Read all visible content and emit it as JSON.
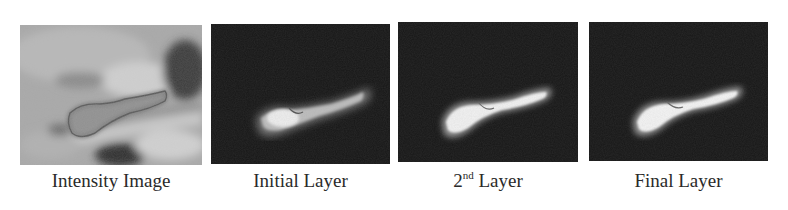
{
  "figure": {
    "panels": [
      {
        "id": "intensity",
        "caption": "Intensity Image",
        "type": "grayscale-mri-with-contour"
      },
      {
        "id": "initial",
        "caption": "Initial Layer",
        "type": "probability-map"
      },
      {
        "id": "second",
        "caption_base": "2",
        "caption_sup": "nd",
        "caption_rest": " Layer",
        "type": "probability-map"
      },
      {
        "id": "final",
        "caption": "Final Layer",
        "type": "probability-map"
      }
    ],
    "colors": {
      "background": "#ffffff",
      "map_background": "#161616",
      "structure_bright": "#f4f4f4",
      "contour": "#5a5a5a",
      "caption_text": "#2a2a2a"
    }
  }
}
